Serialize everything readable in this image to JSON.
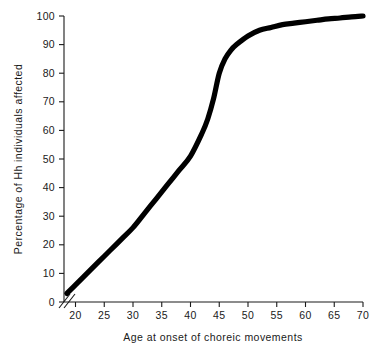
{
  "chart_data": {
    "type": "line",
    "title": "",
    "subtitle": "",
    "xlabel": "Age at onset of choreic movements",
    "ylabel": "Percentage of Hh individuals affected",
    "xlim": [
      18,
      70
    ],
    "ylim": [
      0,
      100
    ],
    "grid": false,
    "legend": "none",
    "axis_break": {
      "axis": "x",
      "symbol": "//",
      "note": "x-axis broken between 0 and 18"
    },
    "x_ticks": [
      "20",
      "25",
      "30",
      "35",
      "40",
      "45",
      "50",
      "55",
      "60",
      "65",
      "70"
    ],
    "x_tick_values": [
      20,
      25,
      30,
      35,
      40,
      45,
      50,
      55,
      60,
      65,
      70
    ],
    "y_ticks": [
      "0",
      "10",
      "20",
      "30",
      "40",
      "50",
      "60",
      "70",
      "80",
      "90",
      "100"
    ],
    "y_tick_values": [
      0,
      10,
      20,
      30,
      40,
      50,
      60,
      70,
      80,
      90,
      100
    ],
    "series": [
      {
        "name": "Cumulative percentage affected",
        "color": "#000000",
        "x": [
          18.5,
          20,
          22,
          24,
          26,
          28,
          30,
          32,
          34,
          36,
          38,
          40,
          42,
          43,
          44,
          45,
          46,
          47,
          48,
          50,
          52,
          54,
          56,
          58,
          60,
          62,
          64,
          66,
          68,
          70
        ],
        "values": [
          3,
          6,
          10,
          14,
          18,
          22,
          26,
          31,
          36,
          41,
          46,
          51,
          59,
          64,
          71,
          80,
          85,
          88,
          90,
          93,
          95,
          96,
          97,
          97.5,
          98,
          98.5,
          99,
          99.3,
          99.7,
          100
        ]
      }
    ]
  },
  "axis_titles": {
    "x": "Age at onset of choreic movements",
    "y": "Percentage of Hh individuals affected"
  }
}
